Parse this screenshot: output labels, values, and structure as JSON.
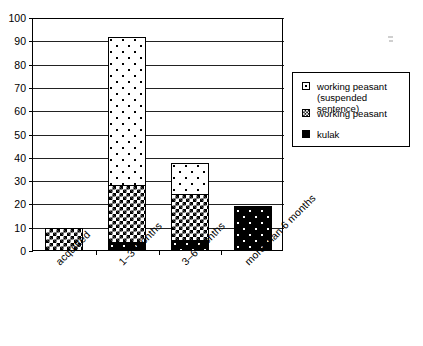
{
  "chart_data": {
    "type": "bar",
    "subtype": "stacked-bar",
    "title": "",
    "xlabel": "",
    "ylabel": "",
    "ylim": [
      0,
      100
    ],
    "ytick_step": 10,
    "yticks": [
      0,
      10,
      20,
      30,
      40,
      50,
      60,
      70,
      80,
      90,
      100
    ],
    "grid": true,
    "grid_axis": "y",
    "legend_position": "right",
    "categories": [
      "acquitted",
      "1–3 months",
      "3–6 months",
      "more than 6 months"
    ],
    "series": [
      {
        "name": "kulak",
        "pattern": "black-with-white-dots",
        "color": "#000000",
        "values": [
          0,
          4,
          5,
          19
        ]
      },
      {
        "name": "working peasant",
        "pattern": "checkerboard",
        "color": "#000000",
        "values": [
          10,
          25,
          20,
          1
        ]
      },
      {
        "name": "working peasant (suspended sentence)",
        "pattern": "white-with-black-dots",
        "color": "#ffffff",
        "values": [
          0,
          64,
          14,
          0
        ]
      }
    ],
    "stack_order_bottom_to_top": [
      "kulak",
      "working peasant",
      "working peasant (suspended sentence)"
    ],
    "totals": [
      10,
      93,
      39,
      20
    ]
  },
  "legend": {
    "items": [
      {
        "label": "working peasant\n(suspended sentence)",
        "swatch": "white-dotted-swatch"
      },
      {
        "label": "working peasant",
        "swatch": "checkerboard-swatch"
      },
      {
        "label": "kulak",
        "swatch": "solid-black-swatch"
      }
    ]
  },
  "axes": {
    "y_tick_labels": [
      "100",
      "90",
      "80",
      "70",
      "60",
      "50",
      "40",
      "30",
      "20",
      "10",
      "0"
    ],
    "x_tick_labels": [
      "acquitted",
      "1–3 months",
      "3–6 months",
      "more than 6 months"
    ]
  },
  "colors": {
    "axis": "#000000",
    "gridline": "#222222",
    "background": "#ffffff",
    "fill_dark": "#000000",
    "fill_light": "#ffffff"
  }
}
